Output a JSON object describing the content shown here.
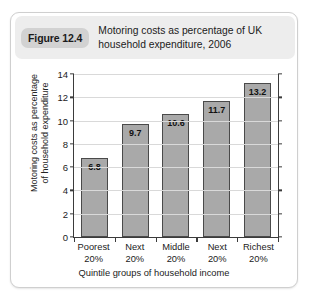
{
  "figure": {
    "badge": "Figure 12.4",
    "title_line1": "Motoring costs as percentage of UK",
    "title_line2": "household expenditure, 2006"
  },
  "chart_data": {
    "type": "bar",
    "title": "Motoring costs as percentage of UK household expenditure, 2006",
    "categories": [
      "Poorest 20%",
      "Next 20%",
      "Middle 20%",
      "Next 20%",
      "Richest 20%"
    ],
    "category_lines": [
      [
        "Poorest",
        "20%"
      ],
      [
        "Next",
        "20%"
      ],
      [
        "Middle",
        "20%"
      ],
      [
        "Next",
        "20%"
      ],
      [
        "Richest",
        "20%"
      ]
    ],
    "values": [
      6.8,
      9.7,
      10.6,
      11.7,
      13.2
    ],
    "data_labels": [
      "6.8",
      "9.7",
      "10.6",
      "11.7",
      "13.2"
    ],
    "xlabel": "Quintile groups of household income",
    "ylabel": "Motoring costs as percentage of household expenditure",
    "ylabel_line1": "Motoring costs as percentage",
    "ylabel_line2": "of household expenditure",
    "ylim": [
      0,
      14
    ],
    "yticks": [
      0,
      2,
      4,
      6,
      8,
      10,
      12,
      14
    ],
    "ytick_labels": [
      "0",
      "2",
      "4",
      "6",
      "8",
      "10",
      "12",
      "14"
    ],
    "grid": true,
    "legend": "none",
    "bar_color": "#a9a9a9",
    "bar_border_color": "#4a4a4a",
    "grid_color": "#d9d9d9",
    "axis_color": "#3b3b3b"
  }
}
